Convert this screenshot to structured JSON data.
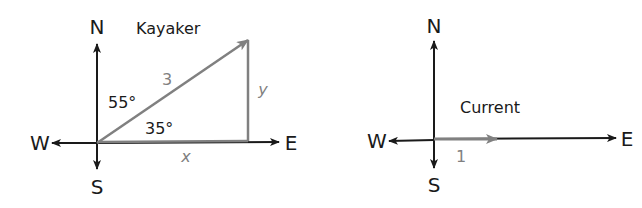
{
  "kayaker_diagram": {
    "title": "Kayaker",
    "compass": {
      "north": "N",
      "south": "S",
      "west": "W",
      "east": "E"
    },
    "vector_magnitude": "3",
    "angle_from_north": "55°",
    "angle_from_east": "35°",
    "horizontal_component": "x",
    "vertical_component": "y"
  },
  "current_diagram": {
    "title": "Current",
    "compass": {
      "north": "N",
      "south": "S",
      "west": "W",
      "east": "E"
    },
    "vector_magnitude": "1"
  },
  "colors": {
    "axis": "#1a1a1a",
    "vector": "#808080"
  }
}
